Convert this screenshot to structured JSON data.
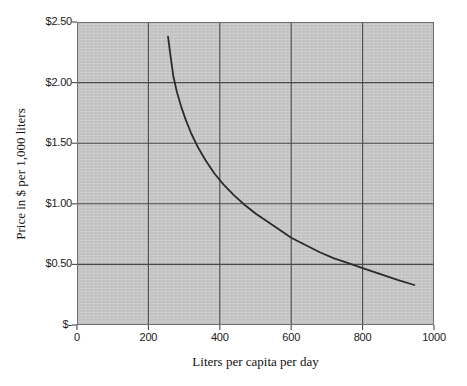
{
  "chart_data": {
    "type": "line",
    "title": "",
    "xlabel": "Liters per capita per day",
    "ylabel": "Price in $ per 1,000 liters",
    "xlim": [
      0,
      1000
    ],
    "ylim": [
      0,
      2.5
    ],
    "grid": true,
    "legend": "none",
    "xticks": [
      {
        "value": 0,
        "label": "0"
      },
      {
        "value": 200,
        "label": "200"
      },
      {
        "value": 400,
        "label": "400"
      },
      {
        "value": 600,
        "label": "600"
      },
      {
        "value": 800,
        "label": "800"
      },
      {
        "value": 1000,
        "label": "1000"
      }
    ],
    "yticks": [
      {
        "value": 0,
        "label": "$-"
      },
      {
        "value": 0.5,
        "label": "$0.50"
      },
      {
        "value": 1.0,
        "label": "$1.00"
      },
      {
        "value": 1.5,
        "label": "$1.50"
      },
      {
        "value": 2.0,
        "label": "$2.00"
      },
      {
        "value": 2.5,
        "label": "$2.50"
      }
    ],
    "series": [
      {
        "name": "Demand curve",
        "color": "#2b2b2b",
        "x": [
          255,
          262,
          270,
          280,
          292,
          305,
          320,
          340,
          360,
          385,
          410,
          440,
          470,
          500,
          530,
          560,
          600,
          640,
          680,
          720,
          760,
          800,
          850,
          900,
          945
        ],
        "y": [
          2.38,
          2.22,
          2.05,
          1.92,
          1.8,
          1.69,
          1.58,
          1.46,
          1.36,
          1.25,
          1.16,
          1.07,
          0.99,
          0.92,
          0.86,
          0.8,
          0.72,
          0.66,
          0.6,
          0.55,
          0.51,
          0.47,
          0.42,
          0.37,
          0.33
        ]
      }
    ]
  },
  "axis": {
    "x_title": "Liters per capita per day",
    "y_title": "Price in $ per 1,000 liters"
  },
  "colors": {
    "plot_background": "#c9c9c9",
    "grid": "#4a4a4a",
    "axis": "#4a4a4a",
    "curve": "#2b2b2b",
    "page_background": "#ffffff"
  }
}
